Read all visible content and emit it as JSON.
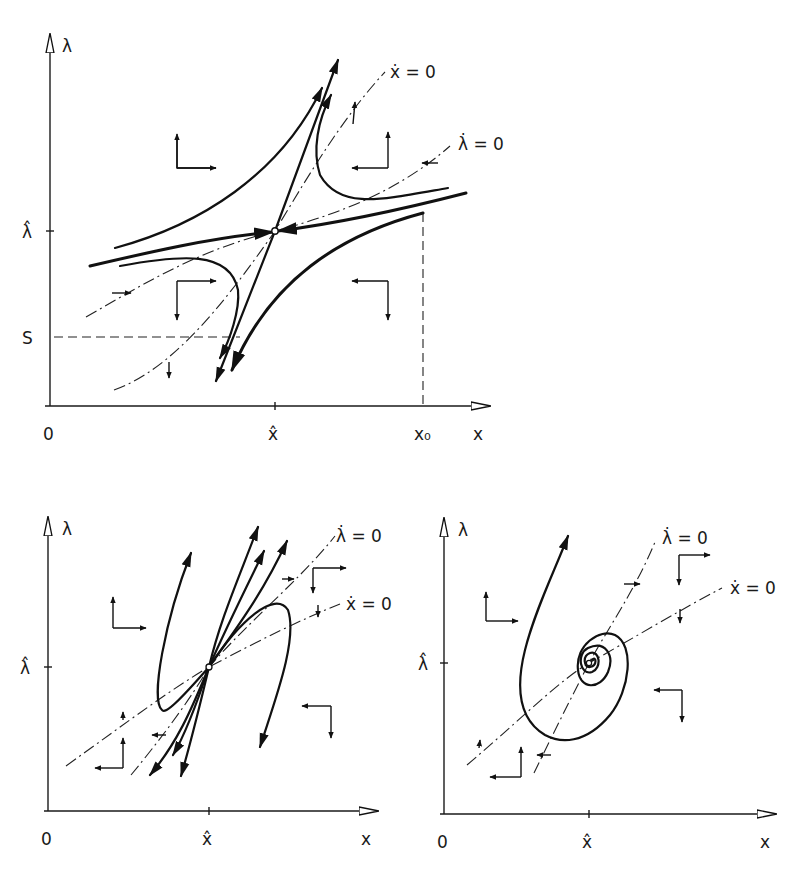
{
  "panels": [
    {
      "id": "saddle",
      "axes": {
        "x_label": "x",
        "y_label": "λ",
        "origin_label": "0"
      },
      "ticks": {
        "x_hat": "x̂",
        "lambda_hat": "λ̂",
        "x0": "x₀",
        "S": "S"
      },
      "isoclines": {
        "x_dot": "ẋ = 0",
        "lambda_dot": "λ̇ = 0"
      },
      "equilibrium": "saddle point"
    },
    {
      "id": "unstable-node",
      "axes": {
        "x_label": "x",
        "y_label": "λ",
        "origin_label": "0"
      },
      "ticks": {
        "x_hat": "x̂",
        "lambda_hat": "λ̂"
      },
      "isoclines": {
        "x_dot": "ẋ = 0",
        "lambda_dot": "λ̇ = 0"
      },
      "equilibrium": "unstable node"
    },
    {
      "id": "unstable-focus",
      "axes": {
        "x_label": "x",
        "y_label": "λ",
        "origin_label": "0"
      },
      "ticks": {
        "x_hat": "x̂",
        "lambda_hat": "λ̂"
      },
      "isoclines": {
        "x_dot": "ẋ = 0",
        "lambda_dot": "λ̇ = 0"
      },
      "equilibrium": "unstable focus"
    }
  ],
  "colors": {
    "ink": "#111111",
    "background": "#ffffff"
  }
}
